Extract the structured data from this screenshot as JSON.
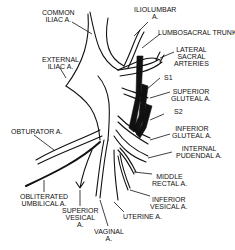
{
  "figure": {
    "labels": {
      "common_iliac": "COMMON\nILIAC A.",
      "external_iliac": "EXTERNAL\nILIAC A.",
      "iliolumbar": "ILIOLUMBAR\nA.",
      "lumbosacral_trunk": "LUMBOSACRAL TRUNK",
      "lateral_sacral": "LATERAL\nSACRAL\nARTERIES",
      "s1": "S1",
      "superior_gluteal": "SUPERIOR\nGLUTEAL A.",
      "s2": "S2",
      "inferior_gluteal": "INFERIOR\nGLUTEAL A.",
      "internal_pudendal": "INTERNAL\nPUDENDAL A.",
      "obturator": "OBTURATOR A.",
      "middle_rectal": "MIDDLE\nRECTAL A.",
      "obliterated_umbilical": "OBLITERATED\nUMBILICAL A.",
      "inferior_vesical": "INFERIOR\nVESICAL A.",
      "superior_vesical": "SUPERIOR\nVESICAL\nA.",
      "uterine": "UTERINE A.",
      "vaginal": "VAGINAL\nA."
    }
  }
}
